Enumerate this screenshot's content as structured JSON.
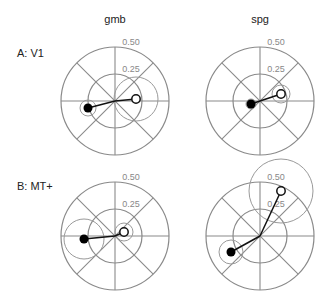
{
  "columns": [
    {
      "label": "gmb",
      "x": 115
    },
    {
      "label": "spg",
      "x": 260
    }
  ],
  "rows": [
    {
      "label": "A: V1",
      "y": 101
    },
    {
      "label": "B: MT+",
      "y": 236
    }
  ],
  "axis": {
    "outer_label": "0.50",
    "inner_label": "0.25",
    "outer_value": 0.5,
    "inner_value": 0.25,
    "radius_px": 54
  },
  "colors": {
    "grid": "#8a8a8a",
    "ring": "#9a9a9a",
    "line": "#111111",
    "filled": "#000000",
    "open_fill": "#ffffff"
  },
  "panels": [
    {
      "row": 0,
      "col": 0,
      "filled": {
        "dx": -27,
        "dy": 7,
        "err": 8
      },
      "open": {
        "dx": 21,
        "dy": -2,
        "err": 22
      }
    },
    {
      "row": 0,
      "col": 1,
      "filled": {
        "dx": -9,
        "dy": 3,
        "err": 5
      },
      "open": {
        "dx": 21,
        "dy": -7,
        "err": 9
      }
    },
    {
      "row": 1,
      "col": 0,
      "filled": {
        "dx": -31,
        "dy": 3,
        "err": 20
      },
      "open": {
        "dx": 9,
        "dy": -4,
        "err": 9
      }
    },
    {
      "row": 1,
      "col": 1,
      "filled": {
        "dx": -29,
        "dy": 16,
        "err": 12
      },
      "open": {
        "dx": 21,
        "dy": -45,
        "err": 32
      }
    }
  ]
}
